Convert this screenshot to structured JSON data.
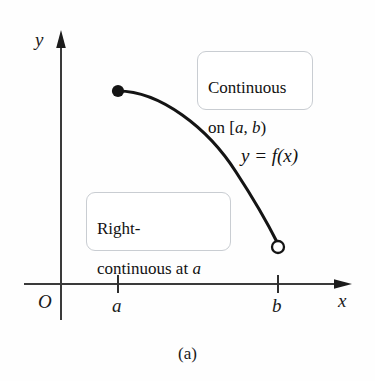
{
  "figure": {
    "caption": "(a)",
    "background_color": "#fefefe",
    "ink_color": "#1a1a1a"
  },
  "axes": {
    "x_axis_label": "x",
    "y_axis_label": "y",
    "origin_label": "O",
    "x_ticks": [
      {
        "label": "a",
        "x_px": 118
      },
      {
        "label": "b",
        "x_px": 278
      }
    ]
  },
  "curve": {
    "function_label": "y = f(x)",
    "left_endpoint": {
      "type": "closed-dot",
      "x_px": 118,
      "y_px": 91
    },
    "right_endpoint": {
      "type": "open-circle",
      "x_px": 278,
      "y_px": 247
    },
    "color": "#141414",
    "stroke_width": 3.1
  },
  "callouts": [
    {
      "name": "continuous-on-interval",
      "line1": "Continuous",
      "line2_prefix": "on [",
      "line2_var1": "a",
      "line2_mid": ", ",
      "line2_var2": "b",
      "line2_suffix": ")"
    },
    {
      "name": "right-continuous-at-a",
      "line1": "Right-",
      "line2_prefix": "continuous at ",
      "line2_var1": "a"
    }
  ]
}
